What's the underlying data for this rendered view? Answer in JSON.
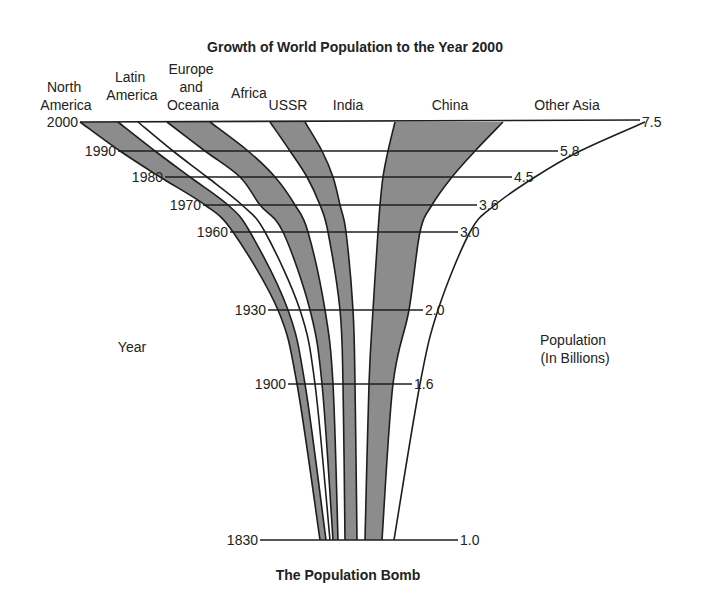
{
  "chart_data": {
    "type": "area",
    "title": "Growth of World Population to the Year 2000",
    "subtitle": "The Population Bomb",
    "xlabel": "Population (In Billions)",
    "ylabel": "Year",
    "years": [
      2000,
      1990,
      1980,
      1970,
      1960,
      1930,
      1900,
      1830
    ],
    "population_billions": [
      7.5,
      5.8,
      4.5,
      3.6,
      3.0,
      2.0,
      1.6,
      1.0
    ],
    "year_labels": [
      "2000",
      "1990",
      "1980",
      "1970",
      "1960",
      "1930",
      "1900",
      "1830"
    ],
    "population_labels": [
      "7.5",
      "5.8",
      "4.5",
      "3.6",
      "3.0",
      "2.0",
      "1.6",
      "1.0"
    ],
    "regions": [
      "North America",
      "Latin America",
      "Europe and Oceania",
      "Africa",
      "USSR",
      "India",
      "China",
      "Other Asia"
    ],
    "shaded_regions": [
      "North America",
      "Europe and Oceania",
      "USSR",
      "China"
    ],
    "grid": true,
    "legend_position": "top"
  },
  "labels": {
    "title": "Growth of World Population to the Year 2000",
    "footer": "The Population Bomb",
    "year_axis": "Year",
    "pop_axis_line1": "Population",
    "pop_axis_line2": "(In Billions)",
    "regions": {
      "north_america": [
        "North",
        "America"
      ],
      "latin_america": [
        "Latin",
        "America"
      ],
      "europe_oceania": [
        "Europe",
        "and",
        "Oceania"
      ],
      "africa": "Africa",
      "ussr": "USSR",
      "india": "India",
      "china": "China",
      "other_asia": "Other Asia"
    }
  },
  "colors": {
    "band": "#8c8c8c",
    "line": "#1e1e1e",
    "background": "#ffffff"
  }
}
